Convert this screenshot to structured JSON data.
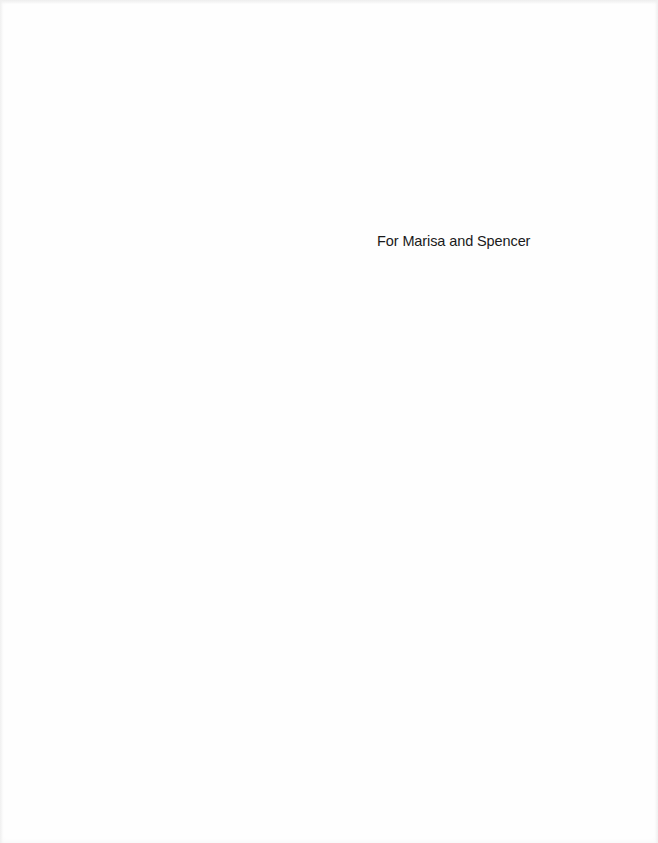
{
  "page": {
    "dedication": "For Marisa and Spencer"
  }
}
